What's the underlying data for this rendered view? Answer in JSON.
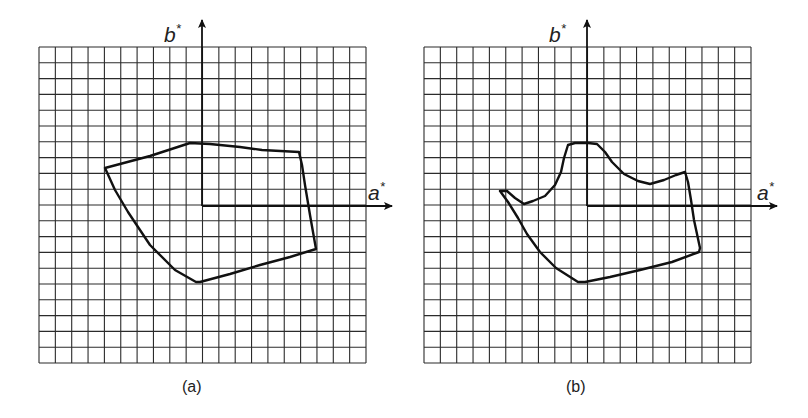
{
  "figure": {
    "panels": [
      {
        "id": "a",
        "caption": "(a)",
        "x_axis_label": "a",
        "y_axis_label": "b",
        "axis_superscript": "*",
        "grid": {
          "cols": 20,
          "rows": 20,
          "left": 39,
          "top": 47,
          "right": 366,
          "bottom": 363
        },
        "origin": {
          "x": 202,
          "y": 206
        },
        "axis_tips": {
          "a_x": 392,
          "b_y": 20
        },
        "label_pos": {
          "b": [
            164,
            42
          ],
          "a": [
            368,
            200
          ],
          "caption": [
            182,
            392
          ]
        },
        "gamut_outline": [
          [
            105,
            168
          ],
          [
            150,
            156
          ],
          [
            190,
            143
          ],
          [
            210,
            144
          ],
          [
            240,
            147
          ],
          [
            262,
            150
          ],
          [
            299,
            152
          ],
          [
            302,
            165
          ],
          [
            305,
            185
          ],
          [
            310,
            215
          ],
          [
            316,
            249
          ],
          [
            290,
            257
          ],
          [
            260,
            265
          ],
          [
            230,
            274
          ],
          [
            200,
            282
          ],
          [
            196,
            282
          ],
          [
            175,
            270
          ],
          [
            150,
            245
          ],
          [
            128,
            212
          ],
          [
            115,
            190
          ],
          [
            105,
            168
          ]
        ]
      },
      {
        "id": "b",
        "caption": "(b)",
        "x_axis_label": "a",
        "y_axis_label": "b",
        "axis_superscript": "*",
        "grid": {
          "cols": 20,
          "rows": 20,
          "left": 424,
          "top": 47,
          "right": 751,
          "bottom": 363
        },
        "origin": {
          "x": 587,
          "y": 206
        },
        "axis_tips": {
          "a_x": 777,
          "b_y": 20
        },
        "label_pos": {
          "b": [
            549,
            42
          ],
          "a": [
            757,
            200
          ],
          "caption": [
            566,
            392
          ]
        },
        "gamut_outline": [
          [
            500,
            191
          ],
          [
            507,
            191
          ],
          [
            515,
            198
          ],
          [
            524,
            204
          ],
          [
            533,
            201
          ],
          [
            545,
            196
          ],
          [
            555,
            185
          ],
          [
            561,
            172
          ],
          [
            564,
            158
          ],
          [
            568,
            145
          ],
          [
            575,
            143
          ],
          [
            588,
            143
          ],
          [
            597,
            144
          ],
          [
            605,
            152
          ],
          [
            612,
            162
          ],
          [
            624,
            174
          ],
          [
            638,
            181
          ],
          [
            650,
            184
          ],
          [
            664,
            180
          ],
          [
            676,
            175
          ],
          [
            685,
            172
          ],
          [
            688,
            182
          ],
          [
            691,
            200
          ],
          [
            694,
            220
          ],
          [
            700,
            248
          ],
          [
            699,
            252
          ],
          [
            672,
            262
          ],
          [
            640,
            270
          ],
          [
            610,
            277
          ],
          [
            585,
            282
          ],
          [
            578,
            282
          ],
          [
            556,
            268
          ],
          [
            540,
            252
          ],
          [
            527,
            234
          ],
          [
            518,
            218
          ],
          [
            508,
            202
          ],
          [
            500,
            191
          ]
        ]
      }
    ]
  },
  "chart_data": {
    "type": "diagram",
    "title": "",
    "panels": [
      {
        "caption": "(a)",
        "xlabel": "a*",
        "ylabel": "b*",
        "grid": "20x20",
        "shape": "convex polygonal gamut boundary"
      },
      {
        "caption": "(b)",
        "xlabel": "a*",
        "ylabel": "b*",
        "grid": "20x20",
        "shape": "irregular (concave) gamut boundary"
      }
    ]
  }
}
